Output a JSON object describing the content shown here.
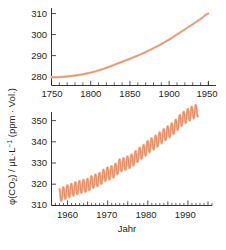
{
  "figure": {
    "name": "atmospheric-co2-concentration-figure",
    "accent_color": "#e8865a",
    "accent_light": "#f3bb9f",
    "text_color": "#231f20",
    "background": "#ffffff",
    "y_axis_label_parts": {
      "phi": "φ(CO",
      "phi_sub": "2",
      "phi_close": ") / μL·L",
      "exponent": "−1",
      "unit_paren": " (ppm · Vol.)"
    },
    "y_axis_label_full": "φ(CO₂) / μL·L⁻¹ (ppm · Vol.)",
    "x_axis_label": "Jahr"
  },
  "chart_data": [
    {
      "id": "top-panel",
      "type": "line",
      "title": "",
      "xlabel": "",
      "ylabel": "φ(CO₂) / μL·L⁻¹ (ppm · Vol.)",
      "xlim": [
        1750,
        1960
      ],
      "ylim": [
        276,
        312
      ],
      "xticks": [
        1750,
        1800,
        1850,
        1900,
        1950
      ],
      "xtick_labels": [
        "1750",
        "1800",
        "1850",
        "1900",
        "1950"
      ],
      "xminor_step": 10,
      "yticks": [
        280,
        290,
        300,
        310
      ],
      "ytick_labels": [
        "280",
        "290",
        "300",
        "310"
      ],
      "grid": false,
      "legend": "none",
      "series": [
        {
          "name": "CO2 ice-core record",
          "color": "#e8865a",
          "x": [
            1750,
            1760,
            1770,
            1780,
            1790,
            1800,
            1810,
            1820,
            1830,
            1840,
            1850,
            1860,
            1870,
            1880,
            1890,
            1900,
            1910,
            1920,
            1930,
            1940,
            1950
          ],
          "values": [
            279.8,
            279.9,
            280.2,
            280.6,
            281.2,
            282.0,
            283.0,
            284.2,
            285.6,
            287.0,
            288.4,
            289.9,
            291.5,
            293.3,
            295.2,
            297.3,
            299.6,
            302.0,
            304.4,
            306.8,
            309.4
          ]
        }
      ]
    },
    {
      "id": "bottom-panel",
      "type": "line",
      "title": "",
      "xlabel": "Jahr",
      "ylabel": "φ(CO₂) / μL·L⁻¹ (ppm · Vol.)",
      "xlim": [
        1956,
        1996
      ],
      "ylim": [
        310,
        356
      ],
      "xticks": [
        1960,
        1970,
        1980,
        1990
      ],
      "xtick_labels": [
        "1960",
        "1970",
        "1980",
        "1990"
      ],
      "xminor_step": 1,
      "xmedium_step": 5,
      "yticks": [
        310,
        320,
        330,
        340,
        350
      ],
      "ytick_labels": [
        "310",
        "320",
        "330",
        "340",
        "350"
      ],
      "grid": false,
      "legend": "none",
      "series": [
        {
          "name": "Keeling curve (Mauna Loa monthly CO2)",
          "color": "#e8865a",
          "seasonal_amplitude": 3.2,
          "x": [
            1958,
            1959,
            1960,
            1961,
            1962,
            1963,
            1964,
            1965,
            1966,
            1967,
            1968,
            1969,
            1970,
            1971,
            1972,
            1973,
            1974,
            1975,
            1976,
            1977,
            1978,
            1979,
            1980,
            1981,
            1982,
            1983,
            1984,
            1985,
            1986,
            1987,
            1988,
            1989,
            1990,
            1991,
            1992
          ],
          "values": [
            315.0,
            315.9,
            316.9,
            317.6,
            318.4,
            319.0,
            319.6,
            320.0,
            321.4,
            322.2,
            323.0,
            324.6,
            325.7,
            326.3,
            327.5,
            329.7,
            330.2,
            331.1,
            332.0,
            333.8,
            335.4,
            336.8,
            338.7,
            340.1,
            341.4,
            343.0,
            344.6,
            346.0,
            347.4,
            349.2,
            351.6,
            353.1,
            354.4,
            355.6,
            356.4
          ]
        }
      ]
    }
  ]
}
